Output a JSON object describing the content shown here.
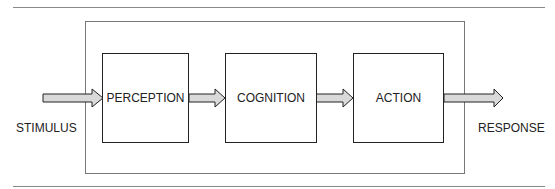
{
  "diagram": {
    "stages": [
      {
        "label": "PERCEPTION"
      },
      {
        "label": "COGNITION"
      },
      {
        "label": "ACTION"
      }
    ],
    "input_label": "STIMULUS",
    "output_label": "RESPONSE",
    "arrow_fill": "#d9d9d9",
    "stroke": "#222222"
  }
}
